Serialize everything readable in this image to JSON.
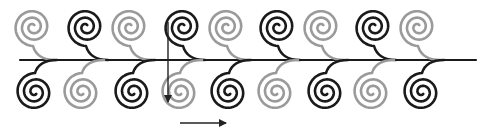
{
  "diagram": {
    "colors": {
      "dark": "#1a1a1a",
      "light": "#9a9a9a",
      "background": "#ffffff",
      "arrow": "#222222"
    },
    "stem": {
      "x1": 20,
      "x2": 476,
      "y": 60
    },
    "top_spirals": [
      {
        "cx": 33,
        "cy": 27,
        "tone": "light"
      },
      {
        "cx": 86,
        "cy": 27,
        "tone": "dark"
      },
      {
        "cx": 130,
        "cy": 27,
        "tone": "light"
      },
      {
        "cx": 183,
        "cy": 27,
        "tone": "dark"
      },
      {
        "cx": 227,
        "cy": 27,
        "tone": "light"
      },
      {
        "cx": 278,
        "cy": 27,
        "tone": "dark"
      },
      {
        "cx": 322,
        "cy": 27,
        "tone": "light"
      },
      {
        "cx": 374,
        "cy": 27,
        "tone": "dark"
      },
      {
        "cx": 418,
        "cy": 27,
        "tone": "light"
      }
    ],
    "bottom_spirals": [
      {
        "cx": 35,
        "cy": 92,
        "tone": "dark"
      },
      {
        "cx": 82,
        "cy": 92,
        "tone": "light"
      },
      {
        "cx": 133,
        "cy": 92,
        "tone": "dark"
      },
      {
        "cx": 180,
        "cy": 92,
        "tone": "light"
      },
      {
        "cx": 229,
        "cy": 92,
        "tone": "dark"
      },
      {
        "cx": 276,
        "cy": 92,
        "tone": "light"
      },
      {
        "cx": 326,
        "cy": 92,
        "tone": "dark"
      },
      {
        "cx": 372,
        "cy": 92,
        "tone": "light"
      },
      {
        "cx": 422,
        "cy": 92,
        "tone": "dark"
      }
    ],
    "arrows": [
      {
        "name": "vertical-arrow",
        "x1": 168,
        "y1": 22,
        "x2": 168,
        "y2": 102
      },
      {
        "name": "horizontal-arrow",
        "x1": 180,
        "y1": 123,
        "x2": 226,
        "y2": 123
      }
    ]
  }
}
